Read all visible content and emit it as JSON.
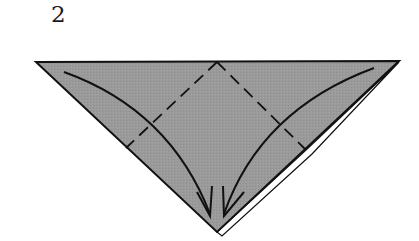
{
  "step": {
    "number": "2"
  },
  "diagram": {
    "type": "origami-fold-step",
    "colors": {
      "paper": "#9a9a9a",
      "outline": "#111111",
      "background": "#ffffff",
      "back_layer": "#ffffff"
    },
    "shape": {
      "left_corner": [
        36,
        62
      ],
      "right_corner": [
        399,
        61
      ],
      "bottom_tip": [
        217,
        232
      ]
    },
    "fold_lines": [
      {
        "name": "left-valley-fold",
        "style": "dashed",
        "from": [
          217,
          62
        ],
        "to": [
          126,
          148
        ]
      },
      {
        "name": "right-valley-fold",
        "style": "dashed",
        "from": [
          217,
          62
        ],
        "to": [
          306,
          150
        ]
      }
    ],
    "arrows": [
      {
        "name": "left-fold-arrow",
        "from": [
          64,
          72
        ],
        "to": [
          210,
          216
        ]
      },
      {
        "name": "right-fold-arrow",
        "from": [
          374,
          68
        ],
        "to": [
          224,
          216
        ]
      }
    ]
  }
}
